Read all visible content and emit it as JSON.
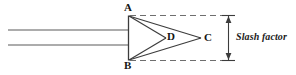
{
  "figure": {
    "background_color": "#ffffff",
    "line_color": "#3c3c3c",
    "dash_color": "#6e6e6e",
    "text_color": "#151515",
    "labels": {
      "A": "A",
      "B": "B",
      "C": "C",
      "D": "D",
      "dimension": "Slash factor"
    },
    "geometry": {
      "beam": {
        "top_line_y": 30,
        "bottom_line_y": 45,
        "x_start": 8,
        "x_end": 128
      },
      "points": {
        "A": [
          128,
          16
        ],
        "B": [
          128,
          60
        ],
        "C": [
          201,
          38
        ],
        "D": [
          166,
          38
        ]
      },
      "dashed_top_y": 16,
      "dashed_bottom_y": 60,
      "dashed_x_start": 130,
      "dashed_x_end": 228,
      "dimension_line_x": 228,
      "dimension_top_y": 16,
      "dimension_bottom_y": 60
    }
  }
}
